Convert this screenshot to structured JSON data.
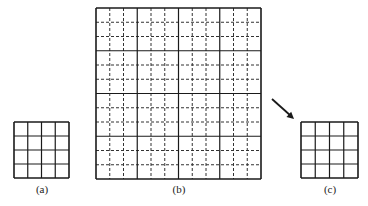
{
  "figure": {
    "panels": [
      {
        "id": "a",
        "label": "(a)",
        "type": "coarse-grid",
        "rows": 4,
        "cols": 4,
        "x": 14,
        "y": 122,
        "w": 55,
        "h": 56,
        "label_x": 42,
        "label_y": 183
      },
      {
        "id": "b",
        "label": "(b)",
        "type": "refined-grid",
        "rows": 4,
        "cols": 4,
        "subdivisions": 3,
        "x": 96,
        "y": 8,
        "w": 165,
        "h": 171,
        "label_x": 179,
        "label_y": 183
      },
      {
        "id": "c",
        "label": "(c)",
        "type": "coarse-grid",
        "rows": 4,
        "cols": 4,
        "x": 301,
        "y": 122,
        "w": 57,
        "h": 56,
        "label_x": 330,
        "label_y": 183
      }
    ],
    "arrow": {
      "from": [
        272,
        99
      ],
      "to": [
        294,
        119
      ],
      "direction": "b-to-c"
    },
    "colors": {
      "line": "#1a1a1a",
      "dash": "#333333",
      "background": "#ffffff"
    }
  }
}
